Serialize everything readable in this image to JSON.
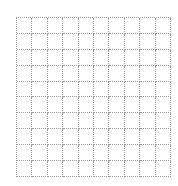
{
  "grid": {
    "rows": 10,
    "columns": 10,
    "line_color": "#9a9a9a",
    "line_style": "dotted",
    "background_color": "#ffffff"
  }
}
